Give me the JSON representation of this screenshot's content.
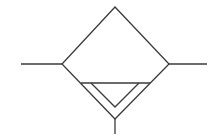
{
  "diagram": {
    "type": "pneumatic-symbol",
    "symbol": "filter-with-drain",
    "stroke_color": "#3a3a3a",
    "background": "#ffffff",
    "diamond": {
      "top": [
        115,
        7
      ],
      "left": [
        62,
        64
      ],
      "right": [
        169,
        64
      ],
      "bottom": [
        115,
        119
      ]
    },
    "inlet_line": {
      "from": [
        21,
        64
      ],
      "to": [
        62,
        64
      ]
    },
    "outlet_line": {
      "from": [
        169,
        64
      ],
      "to": [
        207,
        64
      ]
    },
    "drain_bar": {
      "from": [
        81,
        83
      ],
      "to": [
        150,
        83
      ]
    },
    "inner_triangle": [
      [
        91,
        83
      ],
      [
        139,
        83
      ],
      [
        115,
        107
      ]
    ],
    "drain_stem": {
      "from": [
        115,
        119
      ],
      "to": [
        115,
        134
      ]
    }
  }
}
